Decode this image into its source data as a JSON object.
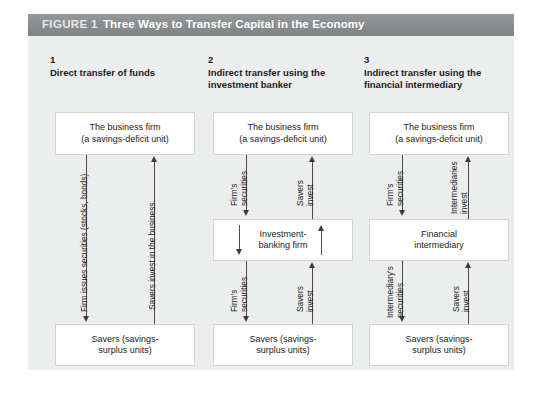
{
  "header": {
    "figure_label": "FIGURE 1",
    "title": "Three Ways to Transfer Capital in the Economy",
    "bar_color": "#8d8f91",
    "panel_color": "#eceded"
  },
  "columns": [
    {
      "number": "1",
      "heading": "Direct transfer of funds",
      "top_box": "The business firm\n(a savings-deficit unit)",
      "top_box_line1": "The business firm",
      "top_box_line2": "(a savings-deficit unit)",
      "middle_box": null,
      "bottom_box_line1": "Savers (savings-",
      "bottom_box_line2": "surplus units)",
      "down_label": "Firm issues securities (stocks, bonds)",
      "up_label": "Savers invest in the business",
      "down_label_lower": null,
      "up_label_lower": null
    },
    {
      "number": "2",
      "heading": "Indirect transfer using the\ninvestment banker",
      "heading_line1": "Indirect transfer using the",
      "heading_line2": "investment banker",
      "top_box_line1": "The business firm",
      "top_box_line2": "(a savings-deficit unit)",
      "middle_box_line1": "Investment-",
      "middle_box_line2": "banking firm",
      "bottom_box_line1": "Savers (savings-",
      "bottom_box_line2": "surplus units)",
      "down_label_upper_line1": "Firm's",
      "down_label_upper_line2": "securities",
      "up_label_upper_line1": "Savers",
      "up_label_upper_line2": "invest",
      "down_label_lower_line1": "Firm's",
      "down_label_lower_line2": "securities",
      "up_label_lower_line1": "Savers",
      "up_label_lower_line2": "invest"
    },
    {
      "number": "3",
      "heading": "Indirect transfer using the\nfinancial intermediary",
      "heading_line1": "Indirect transfer using the",
      "heading_line2": "financial intermediary",
      "top_box_line1": "The business firm",
      "top_box_line2": "(a savings-deficit unit)",
      "middle_box_line1": "Financial",
      "middle_box_line2": "intermediary",
      "bottom_box_line1": "Savers (savings-",
      "bottom_box_line2": "surplus units)",
      "down_label_upper_line1": "Firm's",
      "down_label_upper_line2": "securities",
      "up_label_upper_line1": "Intermediaries",
      "up_label_upper_line2": "invest",
      "down_label_lower_line1": "Intermediary's",
      "down_label_lower_line2": "securities",
      "up_label_lower_line1": "Savers",
      "up_label_lower_line2": "invest"
    }
  ]
}
